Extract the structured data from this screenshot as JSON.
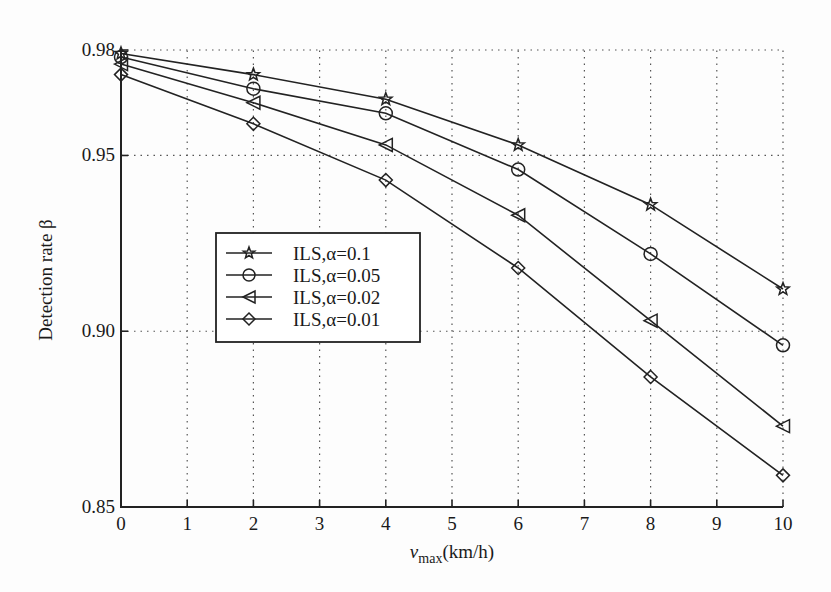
{
  "chart_data": {
    "type": "line",
    "title": "",
    "xlabel": "v_max(km/h)",
    "xlabel_main": "v",
    "xlabel_sub": "max",
    "xlabel_unit": "(km/h)",
    "ylabel": "Detection rate β",
    "x": [
      0,
      2,
      4,
      6,
      8,
      10
    ],
    "xlim": [
      0,
      10
    ],
    "ylim": [
      0.85,
      0.98
    ],
    "xticks": [
      "0",
      "1",
      "2",
      "3",
      "4",
      "5",
      "6",
      "7",
      "8",
      "9",
      "10"
    ],
    "yticks": [
      "0.85",
      "0.90",
      "0.95",
      "0.98"
    ],
    "ytick_values": [
      0.85,
      0.9,
      0.95,
      0.98
    ],
    "grid": true,
    "legend_position": "center-left",
    "series": [
      {
        "name": "ILS,α=0.1",
        "marker": "star",
        "values": [
          0.979,
          0.973,
          0.966,
          0.953,
          0.936,
          0.912
        ]
      },
      {
        "name": "ILS,α=0.05",
        "marker": "circle",
        "values": [
          0.978,
          0.969,
          0.962,
          0.946,
          0.922,
          0.896
        ]
      },
      {
        "name": "ILS,α=0.02",
        "marker": "triangle-left",
        "values": [
          0.976,
          0.965,
          0.953,
          0.933,
          0.903,
          0.873
        ]
      },
      {
        "name": "ILS,α=0.01",
        "marker": "diamond",
        "values": [
          0.973,
          0.959,
          0.943,
          0.918,
          0.887,
          0.859
        ]
      }
    ]
  },
  "colors": {
    "line": "#222222",
    "grid": "#555555",
    "background": "#fdfdfd"
  }
}
